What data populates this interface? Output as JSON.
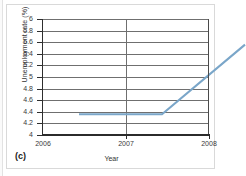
{
  "figure": {
    "panel_label": "(c)",
    "line_color": "#7aa6c9",
    "gridline_color": "#6f6f6f",
    "axis_color": "#2b2b2b",
    "background": "#ffffff"
  },
  "chart_data": {
    "type": "line",
    "title": "",
    "xlabel": "Year",
    "ylabel": "Unemployment rate (%)",
    "xlim": [
      2006,
      2008
    ],
    "ylim": [
      4,
      6
    ],
    "grid": true,
    "legend": "none",
    "xticks": [
      2006,
      2007,
      2008
    ],
    "xtick_labels": [
      "2006",
      "2007",
      "2008"
    ],
    "yticks": [
      4,
      4.2,
      4.4,
      4.6,
      4.8,
      5,
      5.2,
      5.4,
      5.6,
      5.8,
      6
    ],
    "ytick_labels": [
      "4",
      "4.2",
      "4.4",
      "4.6",
      "4.8",
      "5",
      "5.2",
      "5.4",
      "5.6",
      "5.8",
      "6"
    ],
    "series": [
      {
        "name": "Unemployment rate",
        "x": [
          2006,
          2007,
          2008
        ],
        "values": [
          4.6,
          4.6,
          5.8
        ]
      }
    ],
    "annotations": []
  }
}
